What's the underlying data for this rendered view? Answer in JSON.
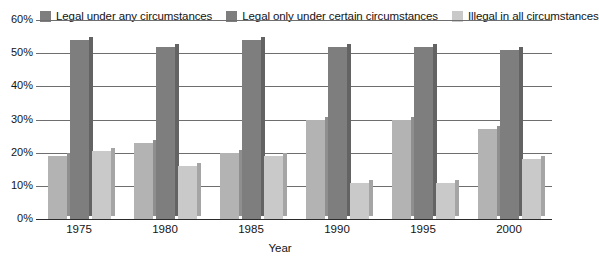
{
  "chart_data": {
    "type": "bar",
    "title": "",
    "subtitle": "",
    "xlabel": "Year",
    "ylabel": "",
    "categories": [
      "1975",
      "1980",
      "1985",
      "1990",
      "1995",
      "2000"
    ],
    "series": [
      {
        "name": "Legal under any circumstances",
        "color": "#b3b3b3",
        "side_color": "#8f8f8f",
        "values": [
          19,
          23,
          20,
          30,
          30,
          27
        ]
      },
      {
        "name": "Legal only under certain circumstances",
        "color": "#7e7e7e",
        "side_color": "#636363",
        "values": [
          54,
          52,
          54,
          52,
          52,
          51
        ]
      },
      {
        "name": "Illegal in all circumstances",
        "color": "#c9c9c9",
        "side_color": "#a5a5a5",
        "values": [
          20.5,
          16,
          19,
          11,
          11,
          18
        ]
      }
    ],
    "ylim": [
      0,
      60
    ],
    "yticks": [
      0,
      10,
      20,
      30,
      40,
      50,
      60
    ],
    "ytick_labels": [
      "0%",
      "10%",
      "20%",
      "30%",
      "40%",
      "50%",
      "60%"
    ],
    "grid": true,
    "legend_position": "top"
  },
  "legend": {
    "items": [
      {
        "label": "Legal under any circumstances",
        "color": "#7e7e7e"
      },
      {
        "label": "Legal only under certain circumstances",
        "color": "#7e7e7e"
      },
      {
        "label": "Illegal in all circumstances",
        "color": "#c9c9c9"
      }
    ]
  },
  "axes": {
    "x_title": "Year"
  }
}
